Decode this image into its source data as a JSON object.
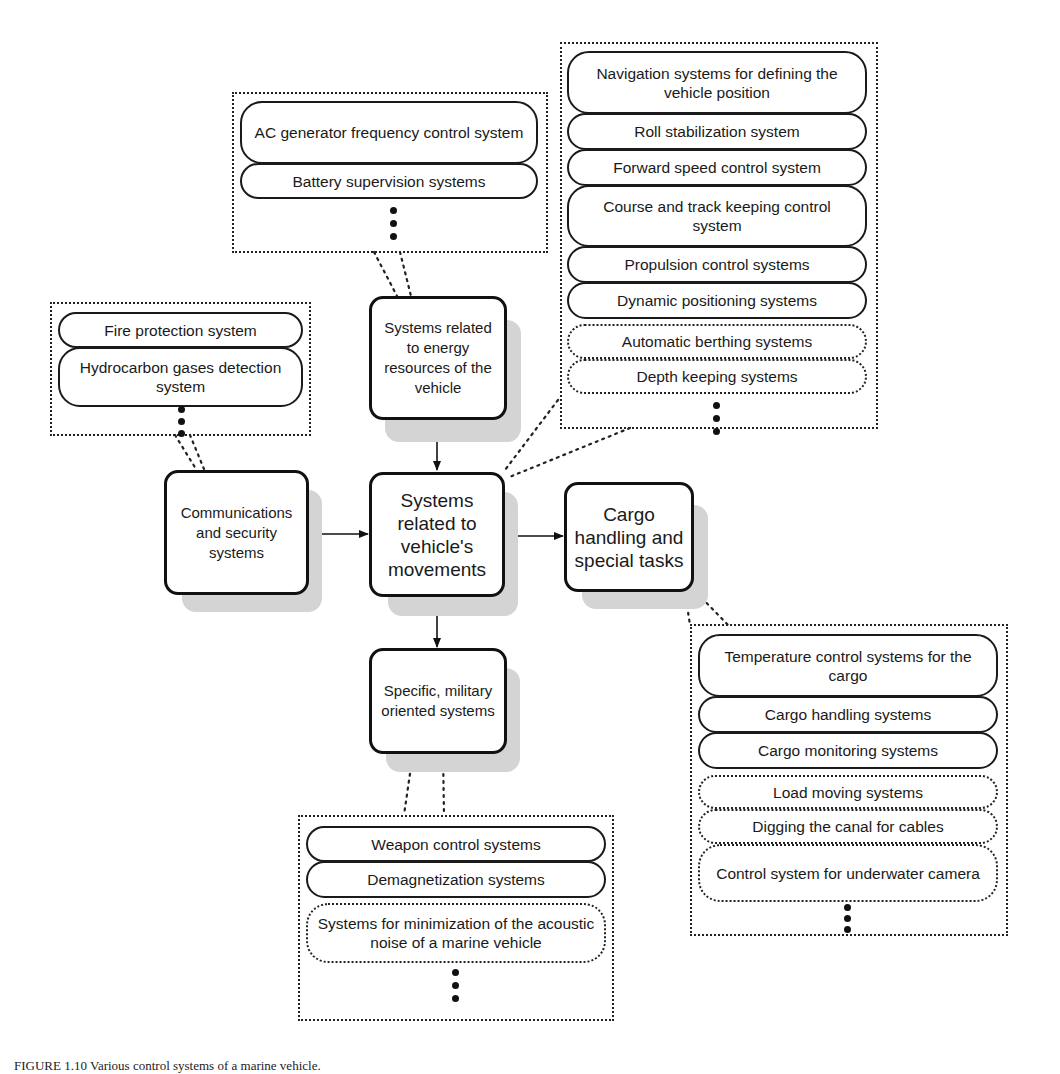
{
  "header": {
    "right_fragment": "...rol systems"
  },
  "central": {
    "label": "Systems related to vehicle's movements"
  },
  "nodes": {
    "energy": "Systems related to energy resources of the vehicle",
    "communications": "Communications and security systems",
    "cargo": "Cargo handling and special tasks",
    "military": "Specific, military oriented systems"
  },
  "groups": {
    "energy": {
      "items": [
        "AC generator frequency control system",
        "Battery supervision systems"
      ],
      "optional_items": [],
      "more": "⋮"
    },
    "movements": {
      "items": [
        "Navigation systems for defining the vehicle position",
        "Roll stabilization system",
        "Forward speed control system",
        "Course and track keeping control system",
        "Propulsion control systems",
        "Dynamic positioning systems"
      ],
      "optional_items": [
        "Automatic berthing systems",
        "Depth keeping systems"
      ],
      "more": "⋮"
    },
    "communications": {
      "items": [
        "Fire protection system",
        "Hydrocarbon gases detection system"
      ],
      "optional_items": [],
      "more": "⋮"
    },
    "cargo": {
      "items": [
        "Temperature control systems for the cargo",
        "Cargo handling systems",
        "Cargo monitoring systems"
      ],
      "optional_items": [
        "Load moving systems",
        "Digging the canal for cables",
        "Control system for underwater camera"
      ],
      "more": "⋮"
    },
    "military": {
      "items": [
        "Weapon control systems",
        "Demagnetization systems"
      ],
      "optional_items": [
        "Systems for minimization of the acoustic noise of a marine vehicle"
      ],
      "more": "⋮"
    }
  },
  "caption": {
    "text": "FIGURE 1.10   Various control systems of a marine vehicle."
  },
  "colors": {
    "line": "#111111",
    "shadow": "#d4d4d4",
    "background": "#ffffff"
  }
}
